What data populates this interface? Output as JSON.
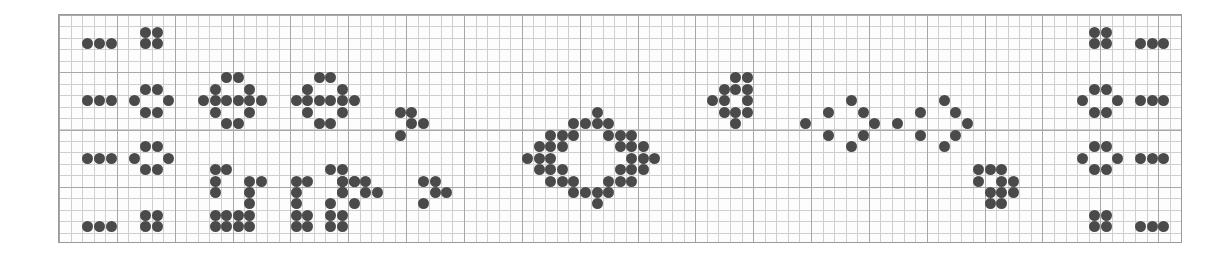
{
  "figure": {
    "type": "dot-pattern-grid",
    "width": 1232,
    "height": 257,
    "background_color": "#ffffff"
  },
  "plot_frame": {
    "left": 58,
    "top": 14,
    "width": 1124,
    "height": 229,
    "border_color": "#9a9a9a",
    "fill_color": "#fdfdfd"
  },
  "grid": {
    "minor_color": "#cfcfcf",
    "major_color": "#a8a8a8",
    "minor_cell_x": 11.57,
    "minor_cell_y": 11.45,
    "major_every": 5,
    "columns": 97,
    "rows": 20
  },
  "dots": {
    "color": "#4a4a4a",
    "diameter": 11,
    "count": 196
  },
  "chart_data": {
    "type": "scatter",
    "title": "",
    "xlabel": "",
    "ylabel": "",
    "grid": true,
    "legend": null,
    "xlim": [
      0,
      97
    ],
    "ylim": [
      0,
      20
    ],
    "marker": "circle",
    "marker_color": "#4a4a4a",
    "marker_size": 11,
    "groups": [
      {
        "name": "left-bar-row-1",
        "points": [
          [
            2,
            2
          ],
          [
            3,
            2
          ],
          [
            4,
            2
          ]
        ]
      },
      {
        "name": "left-square-row-1",
        "points": [
          [
            7,
            1
          ],
          [
            8,
            1
          ],
          [
            7,
            2
          ],
          [
            8,
            2
          ]
        ]
      },
      {
        "name": "left-bar-row-2",
        "points": [
          [
            2,
            7
          ],
          [
            3,
            7
          ],
          [
            4,
            7
          ]
        ]
      },
      {
        "name": "left-diamond-row-2",
        "points": [
          [
            7,
            6
          ],
          [
            8,
            6
          ],
          [
            6,
            7
          ],
          [
            9,
            7
          ],
          [
            7,
            8
          ],
          [
            8,
            8
          ]
        ]
      },
      {
        "name": "left-bar-row-3",
        "points": [
          [
            2,
            12
          ],
          [
            3,
            12
          ],
          [
            4,
            12
          ]
        ]
      },
      {
        "name": "left-diamond-row-3",
        "points": [
          [
            7,
            11
          ],
          [
            8,
            11
          ],
          [
            6,
            12
          ],
          [
            9,
            12
          ],
          [
            7,
            13
          ],
          [
            8,
            13
          ]
        ]
      },
      {
        "name": "left-bar-row-4",
        "points": [
          [
            2,
            18
          ],
          [
            3,
            18
          ],
          [
            4,
            18
          ]
        ]
      },
      {
        "name": "left-square-row-4",
        "points": [
          [
            7,
            17
          ],
          [
            8,
            17
          ],
          [
            7,
            18
          ],
          [
            8,
            18
          ]
        ]
      },
      {
        "name": "hex-cluster-a",
        "points": [
          [
            14,
            5
          ],
          [
            15,
            5
          ],
          [
            13,
            6
          ],
          [
            16,
            6
          ],
          [
            12,
            7
          ],
          [
            13,
            7
          ],
          [
            14,
            7
          ],
          [
            15,
            7
          ],
          [
            16,
            7
          ],
          [
            17,
            7
          ],
          [
            13,
            8
          ],
          [
            16,
            8
          ],
          [
            14,
            9
          ],
          [
            15,
            9
          ]
        ]
      },
      {
        "name": "hex-cluster-b",
        "points": [
          [
            22,
            5
          ],
          [
            23,
            5
          ],
          [
            21,
            6
          ],
          [
            24,
            6
          ],
          [
            20,
            7
          ],
          [
            21,
            7
          ],
          [
            22,
            7
          ],
          [
            23,
            7
          ],
          [
            24,
            7
          ],
          [
            25,
            7
          ],
          [
            21,
            8
          ],
          [
            24,
            8
          ],
          [
            22,
            9
          ],
          [
            23,
            9
          ]
        ]
      },
      {
        "name": "small-zigzag-a",
        "points": [
          [
            29,
            8
          ],
          [
            30,
            8
          ],
          [
            30,
            9
          ],
          [
            31,
            9
          ],
          [
            29,
            10
          ]
        ]
      },
      {
        "name": "bracket-left-outer",
        "points": [
          [
            13,
            13
          ],
          [
            14,
            13
          ],
          [
            13,
            14
          ],
          [
            13,
            15
          ],
          [
            13,
            17
          ],
          [
            14,
            17
          ],
          [
            13,
            18
          ],
          [
            14,
            18
          ]
        ]
      },
      {
        "name": "bracket-left-inner",
        "points": [
          [
            16,
            14
          ],
          [
            17,
            14
          ],
          [
            16,
            15
          ],
          [
            16,
            16
          ],
          [
            15,
            17
          ],
          [
            16,
            17
          ],
          [
            15,
            18
          ],
          [
            16,
            18
          ]
        ]
      },
      {
        "name": "bracket-right-inner",
        "points": [
          [
            20,
            14
          ],
          [
            21,
            14
          ],
          [
            20,
            15
          ],
          [
            20,
            16
          ],
          [
            20,
            17
          ],
          [
            21,
            17
          ],
          [
            20,
            18
          ],
          [
            21,
            18
          ]
        ]
      },
      {
        "name": "bracket-right-outer",
        "points": [
          [
            23,
            13
          ],
          [
            24,
            13
          ],
          [
            24,
            14
          ],
          [
            24,
            15
          ],
          [
            23,
            17
          ],
          [
            24,
            17
          ],
          [
            23,
            18
          ],
          [
            24,
            18
          ]
        ]
      },
      {
        "name": "small-zigzag-b",
        "points": [
          [
            24,
            14
          ],
          [
            25,
            14
          ],
          [
            24,
            15
          ],
          [
            23,
            16
          ]
        ]
      },
      {
        "name": "mini-chevron-left",
        "points": [
          [
            25,
            14
          ],
          [
            26,
            14
          ],
          [
            26,
            15
          ],
          [
            27,
            15
          ],
          [
            25,
            16
          ]
        ]
      },
      {
        "name": "mini-chevron-right",
        "points": [
          [
            31,
            14
          ],
          [
            32,
            14
          ],
          [
            32,
            15
          ],
          [
            33,
            15
          ],
          [
            31,
            16
          ]
        ]
      },
      {
        "name": "big-diamond-ring",
        "points": [
          [
            46,
            8
          ],
          [
            44,
            9
          ],
          [
            45,
            9
          ],
          [
            46,
            9
          ],
          [
            47,
            9
          ],
          [
            42,
            10
          ],
          [
            43,
            10
          ],
          [
            44,
            10
          ],
          [
            47,
            10
          ],
          [
            48,
            10
          ],
          [
            49,
            10
          ],
          [
            41,
            11
          ],
          [
            42,
            11
          ],
          [
            43,
            11
          ],
          [
            48,
            11
          ],
          [
            49,
            11
          ],
          [
            50,
            11
          ],
          [
            40,
            12
          ],
          [
            41,
            12
          ],
          [
            42,
            12
          ],
          [
            49,
            12
          ],
          [
            50,
            12
          ],
          [
            51,
            12
          ],
          [
            41,
            13
          ],
          [
            42,
            13
          ],
          [
            43,
            13
          ],
          [
            48,
            13
          ],
          [
            49,
            13
          ],
          [
            50,
            13
          ],
          [
            42,
            14
          ],
          [
            43,
            14
          ],
          [
            44,
            14
          ],
          [
            47,
            14
          ],
          [
            48,
            14
          ],
          [
            49,
            14
          ],
          [
            44,
            15
          ],
          [
            45,
            15
          ],
          [
            46,
            15
          ],
          [
            47,
            15
          ],
          [
            46,
            16
          ]
        ]
      },
      {
        "name": "arrow-cluster",
        "points": [
          [
            58,
            5
          ],
          [
            59,
            5
          ],
          [
            57,
            6
          ],
          [
            58,
            6
          ],
          [
            59,
            6
          ],
          [
            56,
            7
          ],
          [
            57,
            7
          ],
          [
            59,
            7
          ],
          [
            57,
            8
          ],
          [
            58,
            8
          ],
          [
            59,
            8
          ],
          [
            58,
            9
          ]
        ]
      },
      {
        "name": "chevron-left",
        "points": [
          [
            68,
            7
          ],
          [
            66,
            8
          ],
          [
            69,
            8
          ],
          [
            64,
            9
          ],
          [
            70,
            9
          ],
          [
            66,
            10
          ],
          [
            69,
            10
          ],
          [
            68,
            11
          ]
        ]
      },
      {
        "name": "chevron-right",
        "points": [
          [
            76,
            7
          ],
          [
            74,
            8
          ],
          [
            77,
            8
          ],
          [
            72,
            9
          ],
          [
            78,
            9
          ],
          [
            74,
            10
          ],
          [
            77,
            10
          ],
          [
            76,
            11
          ]
        ]
      },
      {
        "name": "small-cluster-right",
        "points": [
          [
            79,
            13
          ],
          [
            80,
            13
          ],
          [
            81,
            13
          ],
          [
            79,
            14
          ],
          [
            81,
            14
          ],
          [
            82,
            14
          ],
          [
            80,
            15
          ],
          [
            81,
            15
          ],
          [
            82,
            15
          ],
          [
            80,
            16
          ],
          [
            81,
            16
          ]
        ]
      },
      {
        "name": "right-square-row-1",
        "points": [
          [
            89,
            1
          ],
          [
            90,
            1
          ],
          [
            89,
            2
          ],
          [
            90,
            2
          ]
        ]
      },
      {
        "name": "right-bar-row-1",
        "points": [
          [
            93,
            2
          ],
          [
            94,
            2
          ],
          [
            95,
            2
          ]
        ]
      },
      {
        "name": "right-diamond-row-2",
        "points": [
          [
            89,
            6
          ],
          [
            90,
            6
          ],
          [
            88,
            7
          ],
          [
            91,
            7
          ],
          [
            89,
            8
          ],
          [
            90,
            8
          ]
        ]
      },
      {
        "name": "right-bar-row-2",
        "points": [
          [
            93,
            7
          ],
          [
            94,
            7
          ],
          [
            95,
            7
          ]
        ]
      },
      {
        "name": "right-diamond-row-3",
        "points": [
          [
            89,
            11
          ],
          [
            90,
            11
          ],
          [
            88,
            12
          ],
          [
            91,
            12
          ],
          [
            89,
            13
          ],
          [
            90,
            13
          ]
        ]
      },
      {
        "name": "right-bar-row-3",
        "points": [
          [
            93,
            12
          ],
          [
            94,
            12
          ],
          [
            95,
            12
          ]
        ]
      },
      {
        "name": "right-square-row-4",
        "points": [
          [
            89,
            17
          ],
          [
            90,
            17
          ],
          [
            89,
            18
          ],
          [
            90,
            18
          ]
        ]
      },
      {
        "name": "right-bar-row-4",
        "points": [
          [
            93,
            18
          ],
          [
            94,
            18
          ],
          [
            95,
            18
          ]
        ]
      }
    ]
  }
}
